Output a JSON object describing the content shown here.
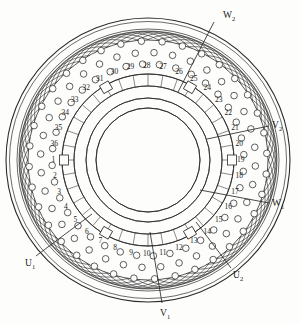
{
  "figure": {
    "type": "stator-winding-diagram",
    "slot_count": 36,
    "colors": {
      "line": "#2b2b2b",
      "background": "#fdfdfc",
      "text": "#1a1a1a"
    }
  },
  "geometry": {
    "center": {
      "x": 148,
      "y": 160
    },
    "radii": {
      "outer_frame": 142,
      "outer_core": 131,
      "coil_band_outer": 120,
      "conductor_ring": 96,
      "slot_ring_outer": 86,
      "slot_ring_inner": 74,
      "bore_outer": 62,
      "bore_inner": 52
    }
  },
  "slots": {
    "numbers": [
      "1",
      "2",
      "3",
      "4",
      "5",
      "6",
      "7",
      "8",
      "9",
      "10",
      "11",
      "12",
      "13",
      "14",
      "15",
      "16",
      "17",
      "18",
      "19",
      "20",
      "21",
      "22",
      "23",
      "24",
      "25",
      "26",
      "27",
      "28",
      "29",
      "30",
      "31",
      "32",
      "33",
      "34",
      "35",
      "36"
    ],
    "start_angle_deg": 185,
    "direction": "counterclockwise"
  },
  "terminals": [
    {
      "id": "W2",
      "letter": "W",
      "sub": "2",
      "label_x": 223,
      "label_y": 11,
      "lead_x1": 214,
      "lead_y1": 22,
      "lead_x2": 178,
      "lead_y2": 92
    },
    {
      "id": "V2",
      "letter": "V",
      "sub": "2",
      "label_x": 272,
      "label_y": 121,
      "lead_x1": 269,
      "lead_y1": 126,
      "lead_x2": 207,
      "lead_y2": 139
    },
    {
      "id": "W1",
      "letter": "W",
      "sub": "1",
      "label_x": 272,
      "label_y": 199,
      "lead_x1": 269,
      "lead_y1": 203,
      "lead_x2": 200,
      "lead_y2": 190
    },
    {
      "id": "U2",
      "letter": "U",
      "sub": "2",
      "label_x": 233,
      "label_y": 271,
      "lead_x1": 231,
      "lead_y1": 268,
      "lead_x2": 196,
      "lead_y2": 222
    },
    {
      "id": "V1",
      "letter": "V",
      "sub": "1",
      "label_x": 160,
      "label_y": 309,
      "lead_x1": 162,
      "lead_y1": 303,
      "lead_x2": 150,
      "lead_y2": 232
    },
    {
      "id": "U1",
      "letter": "U",
      "sub": "1",
      "label_x": 25,
      "label_y": 259,
      "lead_x1": 36,
      "lead_y1": 256,
      "lead_x2": 92,
      "lead_y2": 214
    }
  ]
}
